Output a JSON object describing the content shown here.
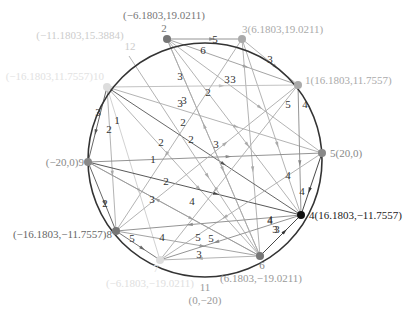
{
  "diagram": {
    "type": "directed-weighted-graph-on-circle",
    "circle": {
      "cx": 205,
      "cy": 160,
      "r": 117,
      "stroke": "#333333"
    },
    "colors": {
      "dark": "#1a1a1a",
      "mid": "#777777",
      "light": "#c8c8c8",
      "label_dark": "#333333",
      "label_light": "#bbbbbb",
      "label_faint": "#dddddd"
    },
    "nodes": [
      {
        "id": "1",
        "x": 298,
        "y": 85,
        "fill": "#aaaaaa",
        "label": "1(16.1803,11.7557)",
        "lx": 305,
        "ly": 84,
        "anchor": "start",
        "lcolor": "#aaaaaa"
      },
      {
        "id": "2",
        "x": 167,
        "y": 39,
        "fill": "#777777",
        "label": "2",
        "lx": 164,
        "ly": 32,
        "anchor": "middle",
        "lcolor": "#777777"
      },
      {
        "id": "3",
        "x": 242,
        "y": 39,
        "fill": "#aaaaaa",
        "label": "3(6.1803,19.0211)",
        "lx": 242,
        "ly": 33,
        "anchor": "start",
        "lcolor": "#aaaaaa"
      },
      {
        "id": "4",
        "x": 301,
        "y": 215,
        "fill": "#111111",
        "label": "4(16.1803,−11.7557)",
        "lx": 309,
        "ly": 219,
        "anchor": "start",
        "lcolor": "#222222"
      },
      {
        "id": "5",
        "x": 322,
        "y": 153,
        "fill": "#888888",
        "label": "5(20,0)",
        "lx": 330,
        "ly": 157,
        "anchor": "start",
        "lcolor": "#888888"
      },
      {
        "id": "6",
        "x": 260,
        "y": 256,
        "fill": "#777777",
        "label": "6",
        "lx": 262,
        "ly": 269,
        "anchor": "middle",
        "lcolor": "#888888"
      },
      {
        "id": "7",
        "x": 160,
        "y": 260,
        "fill": "#dddddd",
        "label": "7",
        "lx": 156,
        "ly": 272,
        "anchor": "middle",
        "lcolor": "#dddddd"
      },
      {
        "id": "8",
        "x": 116,
        "y": 231,
        "fill": "#777777",
        "label": "(−16.1803,−11.7557)8",
        "lx": 112,
        "ly": 238,
        "anchor": "end",
        "lcolor": "#666666"
      },
      {
        "id": "9",
        "x": 88,
        "y": 162,
        "fill": "#888888",
        "label": "(−20,0)9",
        "lx": 84,
        "ly": 166,
        "anchor": "end",
        "lcolor": "#888888"
      },
      {
        "id": "10",
        "x": 107,
        "y": 87,
        "fill": "#dddddd",
        "label": "(−16.1803,11.7557)10",
        "lx": 104,
        "ly": 80,
        "anchor": "end",
        "lcolor": "#e2e2e2"
      },
      {
        "id": "11",
        "x": 205,
        "y": 277,
        "fill": "none",
        "label": "11",
        "lx": 205,
        "ly": 291,
        "anchor": "middle",
        "lcolor": "#999999"
      },
      {
        "id": "12",
        "x": 129,
        "y": 56,
        "fill": "none",
        "label": "12",
        "lx": 130,
        "ly": 50,
        "anchor": "middle",
        "lcolor": "#cccccc"
      }
    ],
    "extra_labels": [
      {
        "text": "(−6.1803,19.0211)",
        "x": 164,
        "y": 19,
        "anchor": "middle",
        "color": "#777777"
      },
      {
        "text": "(−11.1803,15.3884)",
        "x": 80,
        "y": 39,
        "anchor": "middle",
        "color": "#cccccc"
      },
      {
        "text": "(−6.1803,−19.0211)",
        "x": 150,
        "y": 287,
        "anchor": "middle",
        "color": "#e0e0e0"
      },
      {
        "text": "(0,−20)",
        "x": 205,
        "y": 304,
        "anchor": "middle",
        "color": "#999999"
      },
      {
        "text": "(6.1803,−19.0211)",
        "x": 261,
        "y": 282,
        "anchor": "middle",
        "color": "#999999"
      }
    ],
    "edges": [
      {
        "from": "2",
        "to": "3",
        "w": "5",
        "color": "#888888",
        "lx": 215,
        "ly": 43
      },
      {
        "from": "2",
        "to": "1",
        "w": "6",
        "color": "#999999",
        "lx": 203,
        "ly": 54
      },
      {
        "from": "3",
        "to": "1",
        "w": "3",
        "color": "#aaaaaa",
        "lx": 270,
        "ly": 63
      },
      {
        "from": "2",
        "to": "5",
        "w": "3",
        "color": "#aaaaaa",
        "lx": 227,
        "ly": 83
      },
      {
        "from": "2",
        "to": "4",
        "w": "2",
        "color": "#aaaaaa",
        "lx": 208,
        "ly": 96
      },
      {
        "from": "2",
        "to": "6",
        "w": "3",
        "color": "#aaaaaa",
        "lx": 180,
        "ly": 80
      },
      {
        "from": "3",
        "to": "6",
        "w": "3",
        "color": "#aaaaaa",
        "lx": 233,
        "ly": 83
      },
      {
        "from": "3",
        "to": "4",
        "w": "5",
        "color": "#aaaaaa",
        "lx": 288,
        "ly": 108
      },
      {
        "from": "3",
        "to": "8",
        "w": "3",
        "color": "#aaaaaa",
        "lx": 184,
        "ly": 104
      },
      {
        "from": "10",
        "to": "1",
        "w": "3",
        "color": "#bbbbbb",
        "lx": 180,
        "ly": 107
      },
      {
        "from": "10",
        "to": "5",
        "w": "2",
        "color": "#aaaaaa",
        "lx": 183,
        "ly": 126
      },
      {
        "from": "10",
        "to": "4",
        "w": "2",
        "color": "#555555",
        "lx": 191,
        "ly": 143
      },
      {
        "from": "10",
        "to": "6",
        "w": "2",
        "color": "#aaaaaa",
        "lx": 161,
        "ly": 146
      },
      {
        "from": "10",
        "to": "9",
        "w": "3",
        "color": "#555555",
        "lx": 98,
        "ly": 116
      },
      {
        "from": "10",
        "to": "8",
        "w": "2",
        "color": "#aaaaaa",
        "lx": 109,
        "ly": 133
      },
      {
        "from": "10",
        "to": "7",
        "w": "1",
        "color": "#cccccc",
        "lx": 117,
        "ly": 124
      },
      {
        "from": "9",
        "to": "5",
        "w": "1",
        "color": "#888888",
        "lx": 153,
        "ly": 163
      },
      {
        "from": "9",
        "to": "4",
        "w": "2",
        "color": "#444444",
        "lx": 166,
        "ly": 185
      },
      {
        "from": "9",
        "to": "6",
        "w": "3",
        "color": "#aaaaaa",
        "lx": 152,
        "ly": 203
      },
      {
        "from": "9",
        "to": "8",
        "w": "2",
        "color": "#555555",
        "lx": 105,
        "ly": 207
      },
      {
        "from": "8",
        "to": "1",
        "w": "4",
        "color": "#aaaaaa",
        "lx": 192,
        "ly": 205
      },
      {
        "from": "8",
        "to": "6",
        "w": "4",
        "color": "#999999",
        "lx": 162,
        "ly": 241
      },
      {
        "from": "8",
        "to": "7",
        "w": "5",
        "color": "#666666",
        "lx": 132,
        "ly": 242
      },
      {
        "from": "1",
        "to": "4",
        "w": "4",
        "color": "#888888",
        "lx": 305,
        "ly": 108
      },
      {
        "from": "1",
        "to": "7",
        "w": "4",
        "color": "#aaaaaa",
        "lx": 288,
        "ly": 179
      },
      {
        "from": "5",
        "to": "7",
        "w": "4",
        "color": "#aaaaaa",
        "lx": 270,
        "ly": 224
      },
      {
        "from": "5",
        "to": "4",
        "w": "4",
        "color": "#333333",
        "lx": 302,
        "ly": 195
      },
      {
        "from": "4",
        "to": "7",
        "w": "5",
        "color": "#888888",
        "lx": 211,
        "ly": 242
      },
      {
        "from": "4",
        "to": "8",
        "w": "4",
        "color": "#888888",
        "lx": 270,
        "ly": 223
      },
      {
        "from": "6",
        "to": "4",
        "w": "3",
        "color": "#333333",
        "lx": 277,
        "ly": 233
      },
      {
        "from": "12",
        "to": "6",
        "w": "3",
        "color": "#aaaaaa",
        "lx": 275,
        "ly": 233
      },
      {
        "from": "6",
        "to": "7",
        "w": "3",
        "color": "#aaaaaa",
        "lx": 199,
        "ly": 258
      },
      {
        "from": "6",
        "to": "9",
        "w": "5",
        "color": "#999999",
        "lx": 198,
        "ly": 241
      },
      {
        "from": "6",
        "to": "2",
        "w": "3",
        "color": "#aaaaaa",
        "lx": 216,
        "ly": 148
      }
    ]
  }
}
